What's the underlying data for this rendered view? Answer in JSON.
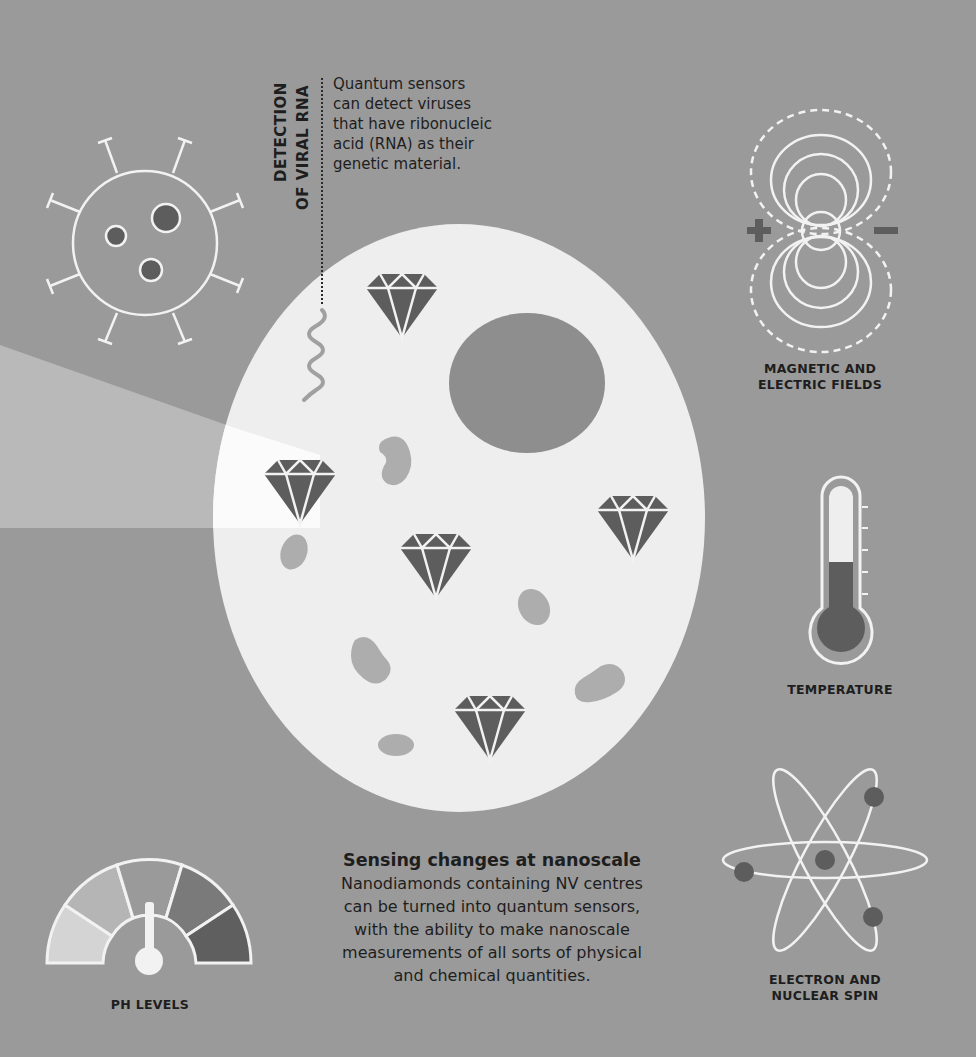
{
  "colors": {
    "background": "#9a9a9a",
    "cell": "#eeeeee",
    "nucleus": "#8e8e8e",
    "diamond": "#5d5d5d",
    "organelle": "#adadad",
    "beam": "#b9b9b9",
    "line": "#f2f2f2",
    "text": "#1e1e1e"
  },
  "viral_rna": {
    "heading_line1": "DETECTION",
    "heading_line2": "OF VIRAL RNA",
    "description_lines": [
      "Quantum sensors",
      "can detect viruses",
      "that have ribonucleic",
      "acid (RNA) as their",
      "genetic material."
    ]
  },
  "sensors": {
    "fields": {
      "label_line1": "MAGNETIC AND",
      "label_line2": "ELECTRIC FIELDS",
      "plus": "+",
      "minus": "−"
    },
    "temperature": {
      "label": "TEMPERATURE"
    },
    "spin": {
      "label_line1": "ELECTRON AND",
      "label_line2": "NUCLEAR SPIN"
    },
    "ph": {
      "label": "PH LEVELS"
    }
  },
  "caption": {
    "title": "Sensing changes at nanoscale",
    "lines": [
      "Nanodiamonds containing NV centres",
      "can be turned into quantum sensors,",
      "with the ability to make nanoscale",
      "measurements of all sorts of physical",
      "and chemical quantities."
    ]
  }
}
